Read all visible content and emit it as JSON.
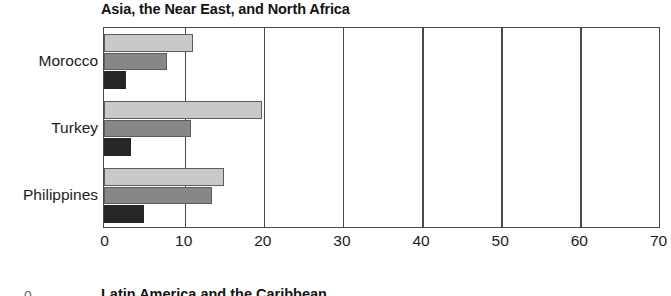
{
  "chart_data": {
    "type": "bar",
    "orientation": "horizontal",
    "title": "Asia, the Near East, and North Africa",
    "xlabel": "",
    "ylabel": "",
    "categories": [
      "Morocco",
      "Turkey",
      "Philippines"
    ],
    "xticks": [
      0,
      10,
      20,
      30,
      40,
      50,
      60,
      70
    ],
    "xlim": [
      0,
      70
    ],
    "grid": true,
    "grid_axis": "x",
    "legend": "none",
    "series": [
      {
        "name": "series-1",
        "color": "#c9c9c9",
        "values": [
          11.2,
          20.0,
          15.1
        ]
      },
      {
        "name": "series-2",
        "color": "#878787",
        "values": [
          7.9,
          11.0,
          13.7
        ]
      },
      {
        "name": "series-3",
        "color": "#262626",
        "values": [
          2.8,
          3.4,
          5.0
        ]
      }
    ]
  },
  "next_panel": {
    "title": "Latin America and the Caribbean",
    "tick": "0"
  }
}
